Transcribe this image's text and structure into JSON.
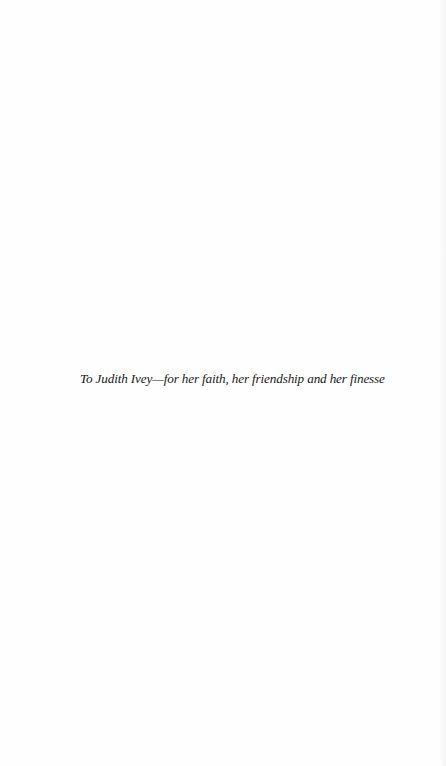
{
  "page": {
    "dedication": "To Judith Ivey—for her faith, her friendship and her finesse"
  }
}
